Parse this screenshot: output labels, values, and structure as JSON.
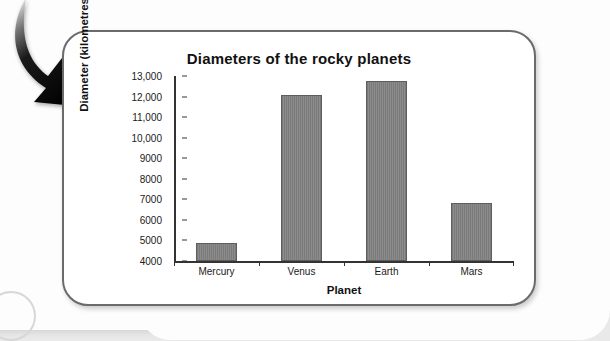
{
  "figure": {
    "arrow_icon": "curved-down-arrow-icon"
  },
  "chart_data": {
    "type": "bar",
    "title": "Diameters of the rocky planets",
    "xlabel": "Planet",
    "ylabel": "Diameter (kilometres)",
    "categories": [
      "Mercury",
      "Venus",
      "Earth",
      "Mars"
    ],
    "values": [
      4880,
      12100,
      12750,
      6800
    ],
    "ylim": [
      4000,
      13000
    ],
    "ytick_labels": [
      "13,000",
      "12,000",
      "11,000",
      "10,000",
      "9000",
      "8000",
      "7000",
      "6000",
      "5000",
      "4000"
    ],
    "ytick_values": [
      13000,
      12000,
      11000,
      10000,
      9000,
      8000,
      7000,
      6000,
      5000,
      4000
    ],
    "grid": false,
    "legend": false,
    "bar_color": "#808080",
    "axis_color": "#333333"
  }
}
